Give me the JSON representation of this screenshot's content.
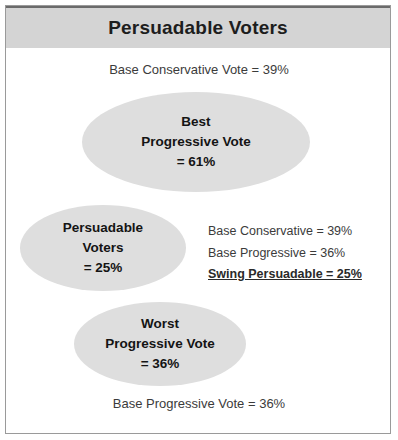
{
  "header": {
    "title": "Persuadable Voters"
  },
  "captions": {
    "top": "Base Conservative Vote = 39%",
    "bottom": "Base Progressive Vote = 36%"
  },
  "ellipses": {
    "best": {
      "line1": "Best",
      "line2": "Progressive Vote",
      "line3": "= 61%"
    },
    "persuadable": {
      "line1": "Persuadable",
      "line2": "Voters",
      "line3": "= 25%"
    },
    "worst": {
      "line1": "Worst",
      "line2": "Progressive Vote",
      "line3": "= 36%"
    }
  },
  "legend": {
    "line1": "Base Conservative = 39%",
    "line2": "Base Progressive = 36%",
    "line3": "Swing Persuadable = 25%"
  },
  "chart_data": {
    "type": "diagram",
    "title": "Persuadable Voters",
    "annotations": [
      "Base Conservative Vote = 39%",
      "Base Progressive Vote = 36%"
    ],
    "categories": [
      "Best Progressive Vote",
      "Persuadable Voters",
      "Worst Progressive Vote",
      "Base Conservative",
      "Base Progressive",
      "Swing Persuadable"
    ],
    "values": [
      61,
      25,
      36,
      39,
      36,
      25
    ],
    "unit": "%"
  }
}
